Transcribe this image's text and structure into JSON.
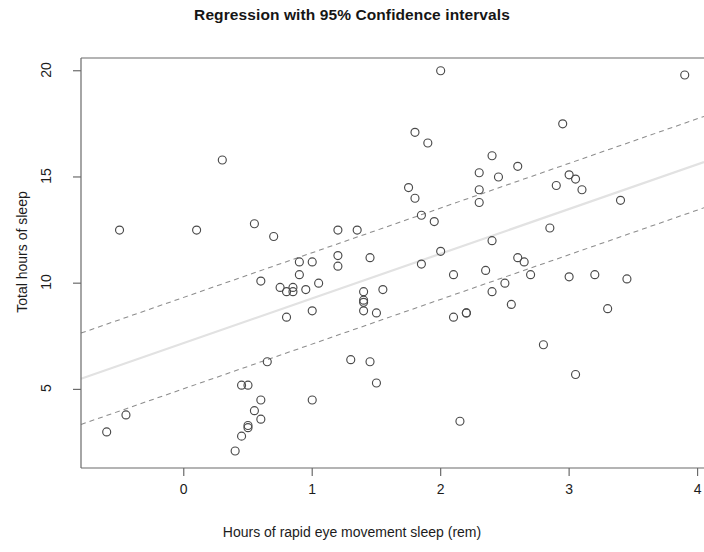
{
  "chart_data": {
    "type": "scatter",
    "title": "Regression with 95% Confidence intervals",
    "xlabel": "Hours of rapid eye movement sleep (rem)",
    "ylabel": "Total hours of sleep",
    "xlim": [
      -0.8,
      4.05
    ],
    "ylim": [
      1.3,
      20.6
    ],
    "xticks": [
      0,
      1,
      2,
      3,
      4
    ],
    "xtick_labels": [
      "0",
      "1",
      "2",
      "3",
      "4"
    ],
    "yticks": [
      5,
      10,
      15,
      20
    ],
    "ytick_labels": [
      "5",
      "10",
      "15",
      "20"
    ],
    "grid": false,
    "legend": null,
    "marker": "open-circle",
    "series": [
      {
        "name": "observations",
        "x": [
          -0.6,
          -0.5,
          -0.45,
          0.1,
          0.3,
          0.4,
          0.45,
          0.45,
          0.5,
          0.5,
          0.5,
          0.55,
          0.55,
          0.6,
          0.6,
          0.6,
          0.65,
          0.7,
          0.75,
          0.8,
          0.8,
          0.85,
          0.85,
          0.9,
          0.9,
          0.95,
          1.0,
          1.0,
          1.0,
          1.05,
          1.2,
          1.2,
          1.2,
          1.3,
          1.35,
          1.4,
          1.4,
          1.4,
          1.4,
          1.45,
          1.45,
          1.5,
          1.5,
          1.55,
          1.75,
          1.8,
          1.8,
          1.85,
          1.85,
          1.9,
          1.95,
          2.0,
          2.0,
          2.1,
          2.1,
          2.15,
          2.2,
          2.2,
          2.3,
          2.3,
          2.3,
          2.35,
          2.4,
          2.4,
          2.4,
          2.45,
          2.5,
          2.55,
          2.6,
          2.6,
          2.65,
          2.7,
          2.8,
          2.85,
          2.9,
          2.95,
          3.0,
          3.0,
          3.05,
          3.05,
          3.1,
          3.2,
          3.3,
          3.4,
          3.45,
          3.9
        ],
        "y": [
          3.0,
          12.5,
          3.8,
          12.5,
          15.8,
          2.1,
          2.8,
          5.2,
          3.3,
          3.2,
          5.2,
          12.8,
          4.0,
          10.1,
          4.5,
          3.6,
          6.3,
          12.2,
          9.8,
          8.4,
          9.6,
          9.6,
          9.8,
          11.0,
          10.4,
          9.7,
          4.5,
          8.7,
          11.0,
          10.0,
          10.8,
          11.3,
          12.5,
          6.4,
          12.5,
          9.1,
          9.2,
          9.6,
          8.7,
          11.2,
          6.3,
          8.6,
          5.3,
          9.7,
          14.5,
          17.1,
          14.0,
          13.2,
          10.9,
          16.6,
          12.9,
          20.0,
          11.5,
          10.4,
          8.4,
          3.5,
          8.6,
          8.6,
          15.2,
          14.4,
          13.8,
          10.6,
          16.0,
          12.0,
          9.6,
          15.0,
          10.0,
          9.0,
          15.5,
          11.2,
          11.0,
          10.4,
          7.1,
          12.6,
          14.6,
          17.5,
          10.3,
          15.1,
          14.9,
          5.7,
          14.4,
          10.4,
          8.8,
          13.9,
          10.2,
          19.8
        ]
      }
    ],
    "fit_line": {
      "name": "regression line",
      "style": "solid",
      "color": "#e2e2e2",
      "x": [
        -0.8,
        4.05
      ],
      "y": [
        5.5,
        15.7
      ]
    },
    "confidence_bands": {
      "name": "95% Confidence intervals",
      "level": 95,
      "style": "dashed",
      "color": "#8d8d8d",
      "upper": {
        "x": [
          -0.8,
          4.05
        ],
        "y": [
          7.65,
          17.85
        ]
      },
      "lower": {
        "x": [
          -0.8,
          4.05
        ],
        "y": [
          3.35,
          13.55
        ]
      }
    }
  }
}
